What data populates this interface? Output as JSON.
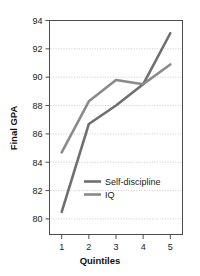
{
  "chart_data": {
    "type": "line",
    "title": "",
    "xlabel": "Quintiles",
    "ylabel": "Final GPA",
    "categories": [
      "1",
      "2",
      "3",
      "4",
      "5"
    ],
    "x": [
      1,
      2,
      3,
      4,
      5
    ],
    "xlim": [
      0.55,
      5.45
    ],
    "ylim": [
      78.9,
      94
    ],
    "yticks": [
      80,
      82,
      84,
      86,
      88,
      90,
      92,
      94
    ],
    "ytick_labels": [
      "80",
      "82",
      "84",
      "86",
      "88",
      "90",
      "92",
      "94"
    ],
    "xtick_labels": [
      "1",
      "2",
      "3",
      "4",
      "5"
    ],
    "grid": "horizontal-dotted",
    "legend_position": "inside-lower-center",
    "series": [
      {
        "name": "Self-discipline",
        "color": "#6f6f6f",
        "values": [
          80.5,
          86.7,
          88.0,
          89.5,
          93.1
        ]
      },
      {
        "name": "IQ",
        "color": "#8a8a8a",
        "values": [
          84.7,
          88.3,
          89.8,
          89.5,
          90.9
        ]
      }
    ]
  },
  "legend": {
    "items": [
      {
        "label": "Self-discipline"
      },
      {
        "label": "IQ"
      }
    ]
  },
  "colors": {
    "axis": "#4d4d4d",
    "grid": "#c8c8c8",
    "text": "#1a1a1a",
    "background": "#ffffff"
  }
}
